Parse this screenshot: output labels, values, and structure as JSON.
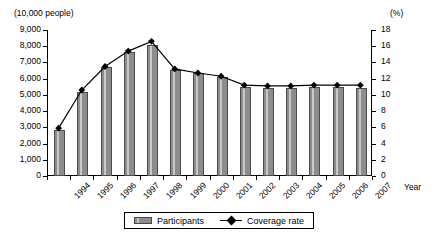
{
  "chart_data": {
    "type": "bar",
    "title": "",
    "subtitle": "",
    "xlabel": "Year",
    "ylabel": "(10,000 people)",
    "y2label": "(%)",
    "categories": [
      "1994",
      "1995",
      "1996",
      "1997",
      "1998",
      "1999",
      "2000",
      "2001",
      "2002",
      "2003",
      "2004",
      "2005",
      "2006",
      "2007"
    ],
    "ylim": [
      0,
      9000
    ],
    "y2lim": [
      0,
      18
    ],
    "y_ticks": [
      "0",
      "1,000",
      "2,000",
      "3,000",
      "4,000",
      "5,000",
      "6,000",
      "7,000",
      "8,000",
      "9,000"
    ],
    "y_tick_values": [
      0,
      1000,
      2000,
      3000,
      4000,
      5000,
      6000,
      7000,
      8000,
      9000
    ],
    "y2_ticks": [
      "0",
      "2",
      "4",
      "6",
      "8",
      "10",
      "12",
      "14",
      "16",
      "18"
    ],
    "y2_tick_values": [
      0,
      2,
      4,
      6,
      8,
      10,
      12,
      14,
      16,
      18
    ],
    "grid": false,
    "legend_position": "bottom",
    "series": [
      {
        "name": "Participants",
        "type": "bar",
        "axis": "left",
        "unit": "10,000 people",
        "values": [
          2850,
          5200,
          6750,
          7650,
          8100,
          6550,
          6350,
          6100,
          5500,
          5400,
          5400,
          5500,
          5500,
          5400
        ]
      },
      {
        "name": "Coverage rate",
        "type": "line",
        "axis": "right",
        "unit": "%",
        "marker": "diamond",
        "values": [
          5.9,
          10.6,
          13.5,
          15.4,
          16.6,
          13.2,
          12.7,
          12.3,
          11.2,
          11.1,
          11.1,
          11.2,
          11.2,
          11.2
        ]
      }
    ]
  },
  "labels": {
    "left_unit": "(10,000 people)",
    "right_unit": "(%)",
    "x_axis_title": "Year"
  },
  "legend": {
    "items": [
      {
        "label": "Participants",
        "marker": "bar-swatch"
      },
      {
        "label": "Coverage rate",
        "marker": "diamond-line-swatch"
      }
    ]
  }
}
